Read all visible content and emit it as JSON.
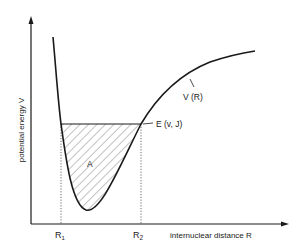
{
  "diagram": {
    "type": "potential-energy-curve",
    "axes": {
      "y_label": "potential energy V",
      "x_label": "internuclear distance R"
    },
    "labels": {
      "curve": "V (R)",
      "energy_level": "E (v, J)",
      "area": "A",
      "r1": "R",
      "r1_sub": "1",
      "r2": "R",
      "r2_sub": "2"
    },
    "colors": {
      "line": "#1a1a1a",
      "hatch": "#555555",
      "background": "#ffffff"
    }
  }
}
